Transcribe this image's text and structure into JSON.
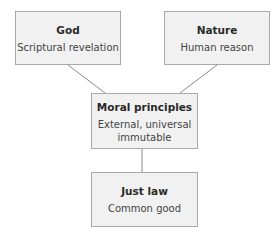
{
  "diagram": {
    "nodes": [
      {
        "id": "god",
        "title": "God",
        "subtitle": "Scriptural revelation"
      },
      {
        "id": "nature",
        "title": "Nature",
        "subtitle": "Human reason"
      },
      {
        "id": "moral",
        "title": "Moral principles",
        "subtitle_line1": "External, universal",
        "subtitle_line2": "immutable"
      },
      {
        "id": "just-law",
        "title": "Just law",
        "subtitle": "Common good"
      }
    ],
    "edges": [
      {
        "from": "god",
        "to": "moral"
      },
      {
        "from": "nature",
        "to": "moral"
      },
      {
        "from": "moral",
        "to": "just-law"
      }
    ],
    "colors": {
      "box_fill": "#f1f1f1",
      "box_border": "#a9a9a9",
      "connector": "#8a8a8a"
    }
  }
}
